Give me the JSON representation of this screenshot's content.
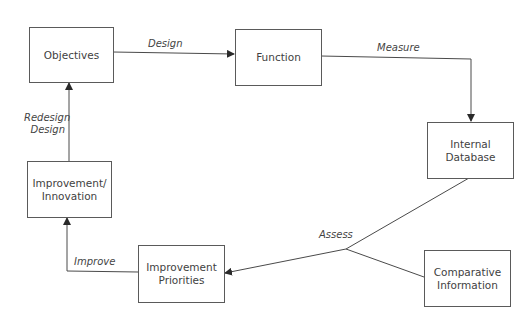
{
  "diagram": {
    "type": "flow-cycle",
    "nodes": {
      "objectives": {
        "label": "Objectives"
      },
      "function": {
        "label": "Function"
      },
      "internal_database": {
        "label": "Internal\nDatabase"
      },
      "improvement_innovation": {
        "label": "Improvement/\nInnovation"
      },
      "improvement_priorities": {
        "label": "Improvement\nPriorities"
      },
      "comparative_information": {
        "label": "Comparative\nInformation"
      }
    },
    "edges": {
      "design": {
        "label": "Design",
        "from": "Objectives",
        "to": "Function"
      },
      "measure": {
        "label": "Measure",
        "from": "Function",
        "to": "Internal Database"
      },
      "assess": {
        "label": "Assess",
        "from": "Internal Database + Comparative Information",
        "to": "Improvement Priorities"
      },
      "improve": {
        "label": "Improve",
        "from": "Improvement Priorities",
        "to": "Improvement/Innovation"
      },
      "redesign": {
        "label": "Redesign\nDesign",
        "from": "Improvement/Innovation",
        "to": "Objectives"
      }
    },
    "colors": {
      "line": "#4a4a4a",
      "border": "#5a5a5a",
      "text": "#3f3f3f",
      "background": "#ffffff"
    }
  }
}
